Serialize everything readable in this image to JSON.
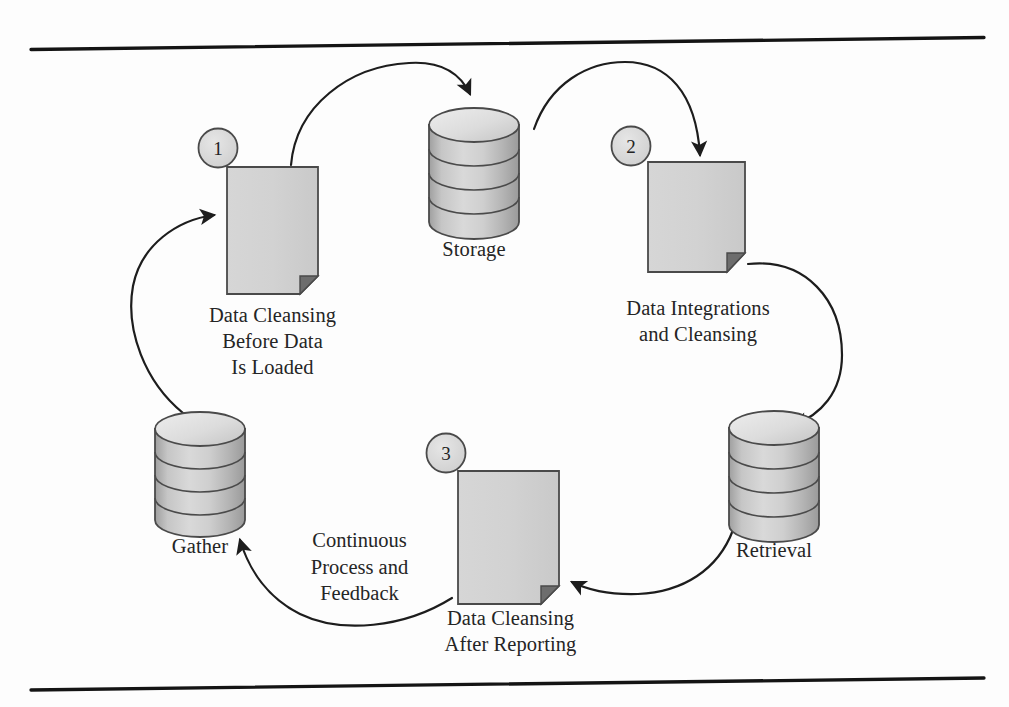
{
  "figure": {
    "background_color": "#fdfdfd",
    "rule_color": "#1a1a1a",
    "shape_fill": "#d2d2d2",
    "shape_stroke": "#4a4a4a",
    "arrow_color": "#1d1d1d",
    "badge_fill": "#d8d8d8"
  },
  "rules": {
    "top_label": "top-rule",
    "bottom_label": "bottom-rule"
  },
  "nodes": {
    "storage": {
      "id": "storage",
      "type": "cylinder",
      "label": "Storage",
      "bands": 4
    },
    "retrieval": {
      "id": "retrieval",
      "type": "cylinder",
      "label": "Retrieval",
      "bands": 4
    },
    "gather": {
      "id": "gather",
      "type": "cylinder",
      "label": "Gather",
      "bands": 4
    },
    "doc_cleansing_before_load": {
      "id": "doc1",
      "type": "document",
      "badge": "1",
      "label": "Data Cleansing\nBefore Data\nIs Loaded"
    },
    "doc_integrations_cleansing": {
      "id": "doc2",
      "type": "document",
      "badge": "2",
      "label": "Data Integrations\nand Cleansing"
    },
    "doc_cleansing_after_reporting": {
      "id": "doc3",
      "type": "document",
      "badge": "3",
      "label": "Data Cleansing\nAfter Reporting"
    }
  },
  "annotations": {
    "center_note": "Continuous\nProcess and\nFeedback"
  },
  "flow": {
    "edges": [
      {
        "from": "doc_cleansing_before_load",
        "to": "storage",
        "name": "arrow-doc1-to-storage"
      },
      {
        "from": "storage",
        "to": "doc_integrations_cleansing",
        "name": "arrow-storage-to-doc2"
      },
      {
        "from": "doc_integrations_cleansing",
        "to": "retrieval",
        "name": "arrow-doc2-to-retrieval"
      },
      {
        "from": "retrieval",
        "to": "doc_cleansing_after_reporting",
        "name": "arrow-retrieval-to-doc3"
      },
      {
        "from": "doc_cleansing_after_reporting",
        "to": "gather",
        "name": "arrow-doc3-to-gather"
      },
      {
        "from": "gather",
        "to": "doc_cleansing_before_load",
        "name": "arrow-gather-to-doc1"
      }
    ]
  }
}
